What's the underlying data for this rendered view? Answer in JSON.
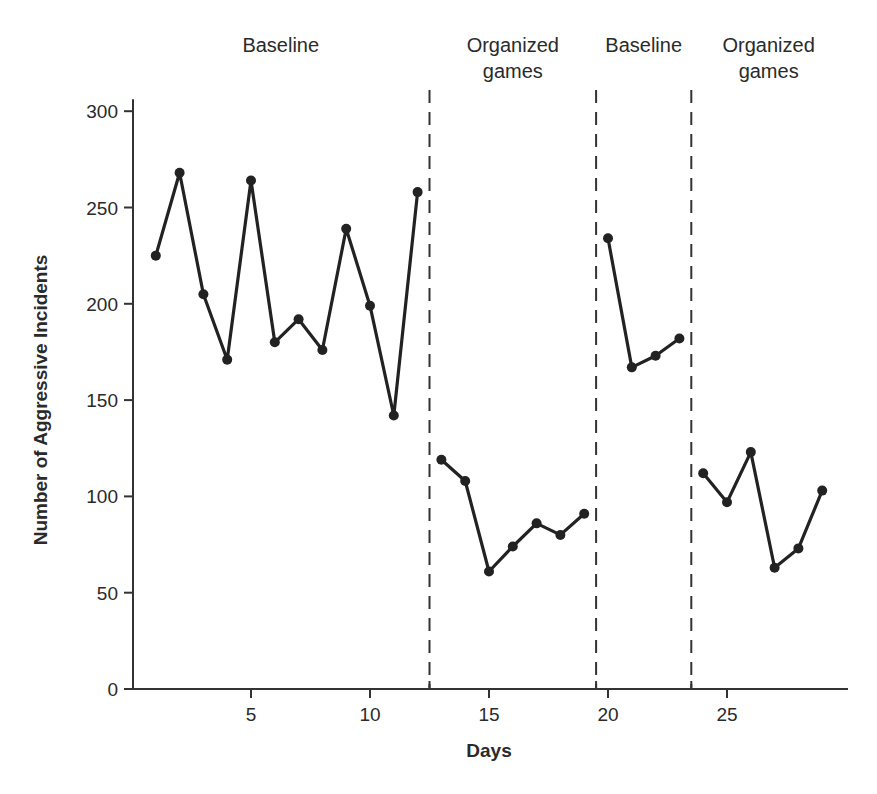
{
  "chart_data": {
    "type": "line",
    "title": "",
    "xlabel": "Days",
    "ylabel": "Number of Aggressive Incidents",
    "xlim": [
      0,
      30
    ],
    "ylim": [
      0,
      300
    ],
    "x_ticks": [
      5,
      10,
      15,
      20,
      25
    ],
    "y_ticks": [
      0,
      50,
      100,
      150,
      200,
      250,
      300
    ],
    "grid": false,
    "legend": null,
    "phase_dividers": [
      12.5,
      19.5,
      23.5
    ],
    "phases": [
      {
        "label_lines": [
          "Baseline"
        ],
        "center_x": 6.25
      },
      {
        "label_lines": [
          "Organized",
          "games"
        ],
        "center_x": 16.0
      },
      {
        "label_lines": [
          "Baseline"
        ],
        "center_x": 21.5
      },
      {
        "label_lines": [
          "Organized",
          "games"
        ],
        "center_x": 26.75
      }
    ],
    "series": [
      {
        "name": "Baseline 1",
        "x": [
          1,
          2,
          3,
          4,
          5,
          6,
          7,
          8,
          9,
          10,
          11,
          12
        ],
        "values": [
          225,
          268,
          205,
          171,
          264,
          180,
          192,
          176,
          239,
          199,
          142,
          258
        ]
      },
      {
        "name": "Organized games 1",
        "x": [
          13,
          14,
          15,
          16,
          17,
          18,
          19
        ],
        "values": [
          119,
          108,
          61,
          74,
          86,
          80,
          91
        ]
      },
      {
        "name": "Baseline 2",
        "x": [
          20,
          21,
          22,
          23
        ],
        "values": [
          234,
          167,
          173,
          182
        ]
      },
      {
        "name": "Organized games 2",
        "x": [
          24,
          25,
          26,
          27,
          28,
          29
        ],
        "values": [
          112,
          97,
          123,
          63,
          73,
          103
        ]
      }
    ]
  },
  "colors": {
    "line": "#222222",
    "axis": "#333333",
    "text": "#2a2a2a"
  }
}
